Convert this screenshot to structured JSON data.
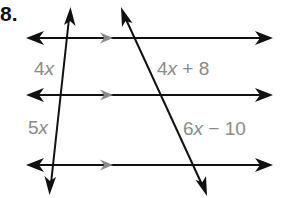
{
  "problem": {
    "number": "8."
  },
  "labels": {
    "left_top": {
      "coef": "4",
      "var": "x",
      "rest": ""
    },
    "right_top": {
      "coef": "4",
      "var": "x",
      "rest": " + 8"
    },
    "left_bottom": {
      "coef": "5",
      "var": "x",
      "rest": ""
    },
    "right_bottom": {
      "coef": "6",
      "var": "x",
      "rest": " − 10"
    }
  },
  "colors": {
    "line": "#111111",
    "parallel_marker": "#8c8c8c",
    "label": "#8a8a8a"
  },
  "geometry": {
    "parallel_lines_y": [
      38,
      95,
      165
    ],
    "transversals": [
      {
        "top": [
          70,
          8
        ],
        "bottom": [
          50,
          195
        ]
      },
      {
        "top": [
          121,
          8
        ],
        "bottom": [
          207,
          196
        ]
      }
    ]
  }
}
